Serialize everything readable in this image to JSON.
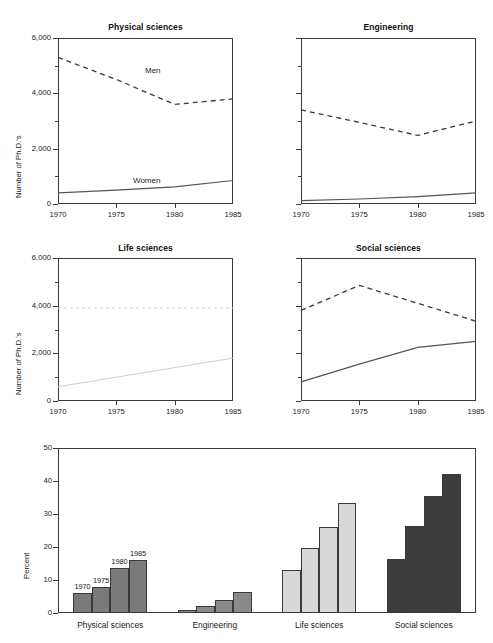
{
  "figure": {
    "ylabel_lines": "Number of Ph.D.'s",
    "xticks": [
      "1970",
      "1975",
      "1980",
      "1985"
    ],
    "yticks_lines": [
      "0",
      "2,000",
      "4,000",
      "6,000"
    ],
    "series_labels": {
      "men": "Men",
      "women": "Women"
    },
    "colors": {
      "axis": "#3b3b3b",
      "men_line": "#3a3a3a",
      "women_line": "#555555",
      "faint_line": "#cfcfcf",
      "bar_physical": "#7a7a7a",
      "bar_engineering": "#8a8a8a",
      "bar_life": "#d8d8d8",
      "bar_social": "#3c3c3c"
    }
  },
  "chart_data": [
    {
      "type": "line",
      "title": "Physical sciences",
      "xlabel": "",
      "ylabel": "Number of Ph.D.'s",
      "x": [
        1970,
        1975,
        1980,
        1985
      ],
      "xlim": [
        1970,
        1985
      ],
      "ylim": [
        0,
        6000
      ],
      "grid": false,
      "legend": "inline-annotations",
      "series": [
        {
          "name": "Men",
          "style": "dashed",
          "values": [
            5300,
            4500,
            3600,
            3800
          ]
        },
        {
          "name": "Women",
          "style": "solid",
          "values": [
            400,
            500,
            620,
            850
          ]
        }
      ]
    },
    {
      "type": "line",
      "title": "Engineering",
      "xlabel": "",
      "ylabel": "",
      "x": [
        1970,
        1975,
        1980,
        1985
      ],
      "xlim": [
        1970,
        1985
      ],
      "ylim": [
        0,
        6000
      ],
      "grid": false,
      "legend": "none",
      "series": [
        {
          "name": "Men",
          "style": "dashed",
          "values": [
            3400,
            2950,
            2480,
            3000
          ]
        },
        {
          "name": "Women",
          "style": "solid",
          "values": [
            120,
            180,
            270,
            400
          ]
        }
      ]
    },
    {
      "type": "line",
      "title": "Life sciences",
      "xlabel": "",
      "ylabel": "Number of Ph.D.'s",
      "x": [
        1970,
        1975,
        1980,
        1985
      ],
      "xlim": [
        1970,
        1985
      ],
      "ylim": [
        0,
        6000
      ],
      "grid": false,
      "legend": "none",
      "series": [
        {
          "name": "Men",
          "style": "dashed-faint",
          "values": [
            3900,
            3900,
            3900,
            3900
          ]
        },
        {
          "name": "Women",
          "style": "solid-faint",
          "values": [
            600,
            1000,
            1400,
            1800
          ]
        }
      ]
    },
    {
      "type": "line",
      "title": "Social sciences",
      "xlabel": "",
      "ylabel": "",
      "x": [
        1970,
        1975,
        1980,
        1985
      ],
      "xlim": [
        1970,
        1985
      ],
      "ylim": [
        0,
        6000
      ],
      "grid": false,
      "legend": "none",
      "series": [
        {
          "name": "Men",
          "style": "dashed",
          "values": [
            3800,
            4850,
            4100,
            3350
          ]
        },
        {
          "name": "Women",
          "style": "solid",
          "values": [
            800,
            1550,
            2250,
            2500
          ]
        }
      ]
    },
    {
      "type": "bar",
      "title": "",
      "xlabel": "",
      "ylabel": "Percent",
      "categories": [
        "Physical sciences",
        "Engineering",
        "Life sciences",
        "Social sciences"
      ],
      "subcategories": [
        "1970",
        "1975",
        "1980",
        "1985"
      ],
      "ylim": [
        0,
        50
      ],
      "yticks": [
        "0",
        "10",
        "20",
        "30",
        "40",
        "50"
      ],
      "grid": false,
      "bar_value_labels_group": "Physical sciences",
      "series": [
        {
          "name": "1970",
          "values": [
            6.2,
            0.8,
            13.0,
            16.5
          ]
        },
        {
          "name": "1975",
          "values": [
            8.0,
            2.1,
            19.8,
            26.3
          ]
        },
        {
          "name": "1980",
          "values": [
            13.5,
            3.9,
            26.0,
            35.4
          ]
        },
        {
          "name": "1985",
          "values": [
            16.0,
            6.3,
            33.2,
            42.2
          ]
        }
      ]
    }
  ]
}
